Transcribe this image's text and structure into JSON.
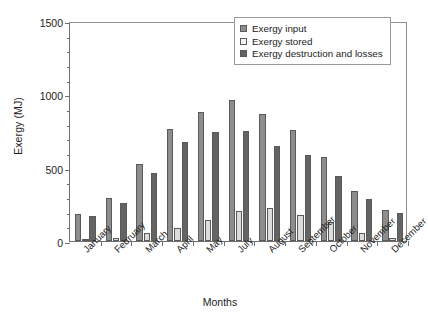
{
  "chart_data": {
    "type": "bar",
    "title": "",
    "xlabel": "Months",
    "ylabel": "Exergy (MJ)",
    "ylim": [
      0,
      1500
    ],
    "yticks": [
      0,
      500,
      1000,
      1500
    ],
    "ytick_labels": [
      "0",
      "500",
      "1000",
      "1500"
    ],
    "minor_tick_interval": 100,
    "grid": false,
    "legend_position": "top-right",
    "categories": [
      "January",
      "February",
      "March",
      "April",
      "May",
      "July",
      "August",
      "September",
      "October",
      "November",
      "December"
    ],
    "series": [
      {
        "name": "Exergy input",
        "color": "#8d8d8d",
        "values": [
          185,
          290,
          525,
          765,
          880,
          960,
          865,
          760,
          575,
          340,
          210
        ]
      },
      {
        "name": "Exergy stored",
        "color": "#dcdcdc",
        "values": [
          15,
          20,
          55,
          90,
          145,
          205,
          225,
          180,
          130,
          55,
          20
        ]
      },
      {
        "name": "Exergy destruction and losses",
        "color": "#646464",
        "values": [
          170,
          260,
          465,
          675,
          740,
          750,
          645,
          585,
          440,
          285,
          190
        ]
      }
    ]
  }
}
